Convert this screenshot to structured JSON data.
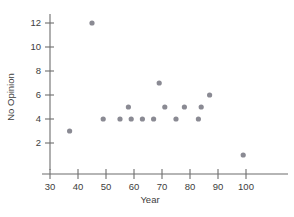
{
  "chart_data": {
    "type": "scatter",
    "title": "",
    "xlabel": "Year",
    "ylabel": "No Opinion",
    "xlim": [
      30,
      107
    ],
    "ylim": [
      0.6,
      13
    ],
    "grid": false,
    "legend": "none",
    "xticks": [
      30,
      40,
      50,
      60,
      70,
      80,
      90,
      100
    ],
    "xtick_labels": [
      "30",
      "40",
      "50",
      "60",
      "70",
      "80",
      "90",
      "100"
    ],
    "yticks": [
      2,
      4,
      6,
      8,
      10,
      12
    ],
    "ytick_labels": [
      "2",
      "4",
      "6",
      "8",
      "10",
      "12"
    ],
    "marker": "circle",
    "marker_color": "#8a8a93",
    "points": [
      {
        "x": 37,
        "y": 3
      },
      {
        "x": 45,
        "y": 12
      },
      {
        "x": 49,
        "y": 4
      },
      {
        "x": 55,
        "y": 4
      },
      {
        "x": 58,
        "y": 5
      },
      {
        "x": 59,
        "y": 4
      },
      {
        "x": 63,
        "y": 4
      },
      {
        "x": 67,
        "y": 4
      },
      {
        "x": 69,
        "y": 7
      },
      {
        "x": 71,
        "y": 5
      },
      {
        "x": 75,
        "y": 4
      },
      {
        "x": 78,
        "y": 5
      },
      {
        "x": 83,
        "y": 4
      },
      {
        "x": 84,
        "y": 5
      },
      {
        "x": 87,
        "y": 6
      },
      {
        "x": 99,
        "y": 1
      }
    ]
  },
  "colors": {
    "marker": "#8a8a93",
    "axis": "#6d6d6d",
    "text": "#3d3d3d",
    "background": "#ffffff"
  }
}
